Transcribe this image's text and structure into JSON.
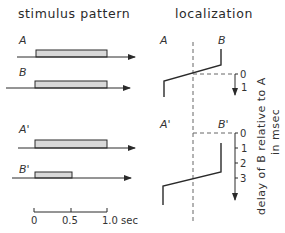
{
  "left_panel": {
    "title": "stimulus pattern",
    "traces": [
      {
        "label": "A",
        "start": 0,
        "end": 1.0
      },
      {
        "label": "B",
        "start": 0,
        "end": 1.0
      },
      {
        "label": "A'",
        "start": 0,
        "end": 1.0
      },
      {
        "label": "B'",
        "start": 0,
        "end": 0.5
      }
    ],
    "scale": {
      "ticks": [
        "0",
        "0.5",
        "1.0 sec"
      ]
    }
  },
  "right_panel": {
    "title": "localization",
    "upper": {
      "left_label": "A",
      "right_label": "B",
      "ticks": [
        "0",
        "1"
      ]
    },
    "lower": {
      "left_label": "A'",
      "right_label": "B'",
      "ticks": [
        "0",
        "1",
        "2",
        "3"
      ]
    },
    "axis_label_line1": "delay of B relative to A",
    "axis_label_line2": "in msec"
  },
  "colors": {
    "line": "#2a2a2a",
    "bar_fill": "#d8d8d8",
    "dashed": "#666666"
  }
}
